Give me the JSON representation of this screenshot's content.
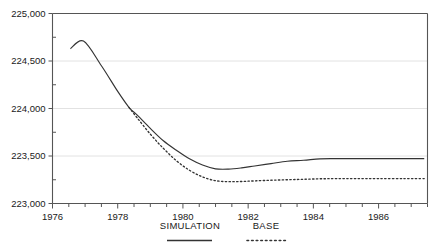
{
  "chart_data": {
    "type": "line",
    "title": "",
    "subtitle": "",
    "xlabel": "",
    "ylabel": "",
    "xlim": [
      1976.0,
      1987.5
    ],
    "ylim": [
      223000,
      225000
    ],
    "yticks": [
      223000,
      223500,
      224000,
      224500,
      225000
    ],
    "ytick_labels": [
      "223,000",
      "223,500",
      "224,000",
      "224,500",
      "225,000"
    ],
    "xticks": [
      1976,
      1978,
      1980,
      1982,
      1984,
      1986
    ],
    "xtick_labels": [
      "1976",
      "1978",
      "1980",
      "1982",
      "1984",
      "1986"
    ],
    "x_minor_tick_interval": 0.5,
    "grid": "horizontal",
    "legend_position": "below",
    "series": [
      {
        "name": "SIMULATION",
        "style": "solid",
        "color": "#333333",
        "x": [
          1976.55,
          1976.95,
          1977.5,
          1978.0,
          1978.35,
          1978.6,
          1979.0,
          1979.4,
          1979.8,
          1980.2,
          1980.6,
          1981.0,
          1981.4,
          1981.8,
          1982.2,
          1982.7,
          1983.2,
          1983.7,
          1984.2,
          1984.7,
          1985.3,
          1986.0,
          1986.8,
          1987.4
        ],
        "y": [
          224630,
          224710,
          224450,
          224180,
          224010,
          223930,
          223790,
          223660,
          223560,
          223470,
          223405,
          223365,
          223362,
          223375,
          223395,
          223420,
          223445,
          223455,
          223470,
          223472,
          223472,
          223472,
          223472,
          223472
        ]
      },
      {
        "name": "BASE",
        "style": "dotted",
        "color": "#333333",
        "x": [
          1978.35,
          1978.6,
          1979.0,
          1979.4,
          1979.8,
          1980.2,
          1980.6,
          1981.0,
          1981.4,
          1981.8,
          1982.2,
          1982.7,
          1983.2,
          1983.7,
          1984.2,
          1984.7,
          1985.3,
          1986.0,
          1986.8,
          1987.4
        ],
        "y": [
          224010,
          223900,
          223730,
          223580,
          223450,
          223350,
          223280,
          223240,
          223230,
          223232,
          223238,
          223245,
          223250,
          223255,
          223260,
          223262,
          223262,
          223262,
          223262,
          223262
        ]
      }
    ],
    "legend": [
      {
        "label": "SIMULATION",
        "style": "solid"
      },
      {
        "label": "BASE",
        "style": "dotted"
      }
    ]
  },
  "colors": {
    "axis": "#555555",
    "grid": "#e2e2e2",
    "line": "#333333",
    "text": "#1a1a1a",
    "background": "#ffffff"
  }
}
